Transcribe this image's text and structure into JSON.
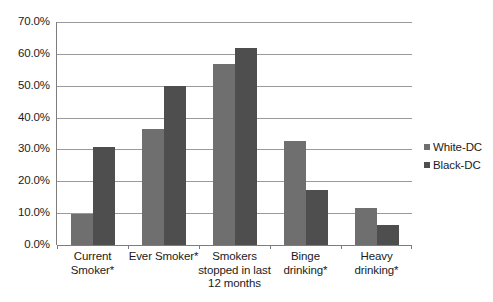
{
  "chart_data": {
    "type": "bar",
    "title": "",
    "subtitle": "",
    "xlabel": "",
    "ylabel": "",
    "ylim": [
      0,
      70
    ],
    "grid": true,
    "legend_position": "right",
    "y_ticks": [
      "0.0%",
      "10.0%",
      "20.0%",
      "30.0%",
      "40.0%",
      "50.0%",
      "60.0%",
      "70.0%"
    ],
    "y_tick_values": [
      0,
      10,
      20,
      30,
      40,
      50,
      60,
      70
    ],
    "categories": [
      "Current Smoker*",
      "Ever Smoker*",
      "Smokers stopped in last 12 months",
      "Binge drinking*",
      "Heavy drinking*"
    ],
    "category_lines": [
      [
        "Current",
        "Smoker*"
      ],
      [
        "Ever Smoker*"
      ],
      [
        "Smokers",
        "stopped in last",
        "12 months"
      ],
      [
        "Binge",
        "drinking*"
      ],
      [
        "Heavy",
        "drinking*"
      ]
    ],
    "series": [
      {
        "name": "White-DC",
        "color": "#6f6f6f",
        "values": [
          9.7,
          36.5,
          56.8,
          32.5,
          11.6
        ]
      },
      {
        "name": "Black-DC",
        "color": "#4e4e4e",
        "values": [
          30.7,
          50.0,
          62.0,
          17.3,
          6.2
        ]
      }
    ]
  },
  "legend": {
    "items": [
      {
        "label": "White-DC",
        "color": "#6f6f6f"
      },
      {
        "label": "Black-DC",
        "color": "#4e4e4e"
      }
    ]
  }
}
